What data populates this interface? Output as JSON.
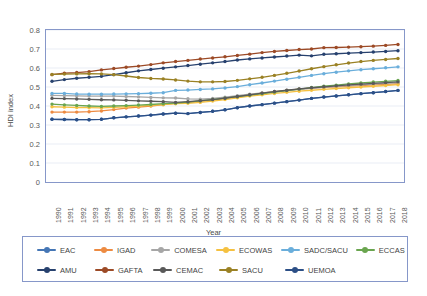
{
  "chart_data": {
    "type": "line",
    "title": "",
    "xlabel": "Year",
    "ylabel": "HDI index",
    "ylim": [
      0,
      0.8
    ],
    "ytick_step": 0.1,
    "yticks": [
      "0",
      "0.1",
      "0.2",
      "0.3",
      "0.4",
      "0.5",
      "0.6",
      "0.7",
      "0.8"
    ],
    "grid": true,
    "legend_position": "bottom",
    "markers": true,
    "x": [
      1990,
      1991,
      1992,
      1993,
      1994,
      1995,
      1996,
      1997,
      1998,
      1999,
      2000,
      2001,
      2002,
      2003,
      2004,
      2005,
      2006,
      2007,
      2008,
      2009,
      2010,
      2011,
      2012,
      2013,
      2014,
      2015,
      2016,
      2017,
      2018
    ],
    "categories": [
      "1990",
      "1991",
      "1992",
      "1993",
      "1994",
      "1995",
      "1996",
      "1997",
      "1998",
      "1999",
      "2000",
      "2001",
      "2002",
      "2003",
      "2004",
      "2005",
      "2006",
      "2007",
      "2008",
      "2009",
      "2010",
      "2011",
      "2012",
      "2013",
      "2014",
      "2015",
      "2016",
      "2017",
      "2018"
    ],
    "series": [
      {
        "name": "EAC",
        "color": "#4576b5",
        "values": [
          0.33,
          0.329,
          0.328,
          0.328,
          0.33,
          0.338,
          0.343,
          0.347,
          0.352,
          0.358,
          0.362,
          0.36,
          0.366,
          0.372,
          0.38,
          0.391,
          0.4,
          0.407,
          0.415,
          0.423,
          0.431,
          0.44,
          0.447,
          0.453,
          0.459,
          0.465,
          0.47,
          0.476,
          0.482
        ]
      },
      {
        "name": "IGAD",
        "color": "#ed8b42",
        "values": [
          0.368,
          0.368,
          0.368,
          0.37,
          0.374,
          0.381,
          0.389,
          0.394,
          0.4,
          0.407,
          0.414,
          0.418,
          0.424,
          0.431,
          0.439,
          0.449,
          0.459,
          0.467,
          0.475,
          0.482,
          0.489,
          0.494,
          0.498,
          0.501,
          0.505,
          0.508,
          0.511,
          0.514,
          0.517
        ]
      },
      {
        "name": "COMESA",
        "color": "#a6a6a6",
        "values": [
          0.456,
          0.455,
          0.453,
          0.452,
          0.452,
          0.452,
          0.45,
          0.448,
          0.445,
          0.443,
          0.442,
          0.438,
          0.436,
          0.44,
          0.446,
          0.454,
          0.462,
          0.469,
          0.476,
          0.482,
          0.488,
          0.493,
          0.498,
          0.503,
          0.507,
          0.511,
          0.515,
          0.519,
          0.523
        ]
      },
      {
        "name": "ECOWAS",
        "color": "#f5c141",
        "values": [
          0.396,
          0.394,
          0.392,
          0.391,
          0.39,
          0.393,
          0.396,
          0.399,
          0.403,
          0.407,
          0.412,
          0.414,
          0.419,
          0.426,
          0.434,
          0.443,
          0.452,
          0.459,
          0.466,
          0.472,
          0.478,
          0.483,
          0.488,
          0.492,
          0.496,
          0.5,
          0.504,
          0.508,
          0.512
        ]
      },
      {
        "name": "SADC/SACU",
        "color": "#6aaedb",
        "values": [
          0.466,
          0.466,
          0.463,
          0.462,
          0.462,
          0.463,
          0.464,
          0.465,
          0.467,
          0.47,
          0.482,
          0.484,
          0.487,
          0.49,
          0.495,
          0.502,
          0.512,
          0.521,
          0.531,
          0.541,
          0.551,
          0.561,
          0.57,
          0.578,
          0.585,
          0.591,
          0.596,
          0.601,
          0.606
        ]
      },
      {
        "name": "ECCAS",
        "color": "#6aa54f",
        "values": [
          0.41,
          0.406,
          0.403,
          0.4,
          0.398,
          0.4,
          0.402,
          0.405,
          0.408,
          0.412,
          0.415,
          0.42,
          0.427,
          0.434,
          0.441,
          0.449,
          0.457,
          0.465,
          0.473,
          0.481,
          0.489,
          0.497,
          0.504,
          0.51,
          0.516,
          0.521,
          0.526,
          0.53,
          0.534
        ]
      },
      {
        "name": "AMU",
        "color": "#27416e",
        "values": [
          0.53,
          0.539,
          0.546,
          0.551,
          0.556,
          0.565,
          0.575,
          0.585,
          0.592,
          0.599,
          0.606,
          0.613,
          0.62,
          0.627,
          0.634,
          0.642,
          0.648,
          0.653,
          0.658,
          0.663,
          0.668,
          0.664,
          0.672,
          0.675,
          0.678,
          0.681,
          0.684,
          0.687,
          0.691
        ]
      },
      {
        "name": "GAFTA",
        "color": "#9c4a26",
        "values": [
          0.565,
          0.573,
          0.576,
          0.581,
          0.59,
          0.597,
          0.604,
          0.61,
          0.618,
          0.627,
          0.634,
          0.64,
          0.647,
          0.653,
          0.659,
          0.666,
          0.673,
          0.681,
          0.687,
          0.692,
          0.697,
          0.7,
          0.707,
          0.708,
          0.71,
          0.712,
          0.715,
          0.719,
          0.724
        ]
      },
      {
        "name": "CEMAC",
        "color": "#595959",
        "values": [
          0.44,
          0.439,
          0.437,
          0.435,
          0.433,
          0.432,
          0.43,
          0.427,
          0.425,
          0.423,
          0.419,
          0.423,
          0.428,
          0.434,
          0.441,
          0.45,
          0.459,
          0.468,
          0.476,
          0.483,
          0.49,
          0.496,
          0.501,
          0.506,
          0.511,
          0.515,
          0.519,
          0.523,
          0.527
        ]
      },
      {
        "name": "SACU",
        "color": "#9a8124",
        "values": [
          0.566,
          0.568,
          0.569,
          0.57,
          0.569,
          0.565,
          0.558,
          0.55,
          0.545,
          0.542,
          0.537,
          0.531,
          0.527,
          0.527,
          0.529,
          0.535,
          0.543,
          0.551,
          0.561,
          0.572,
          0.584,
          0.596,
          0.607,
          0.617,
          0.626,
          0.634,
          0.64,
          0.645,
          0.65
        ]
      },
      {
        "name": "UEMOA",
        "color": "#2c4f86",
        "values": [
          0.33,
          0.329,
          0.328,
          0.328,
          0.33,
          0.338,
          0.343,
          0.347,
          0.352,
          0.358,
          0.362,
          0.36,
          0.366,
          0.372,
          0.38,
          0.391,
          0.4,
          0.407,
          0.415,
          0.423,
          0.431,
          0.44,
          0.447,
          0.453,
          0.459,
          0.465,
          0.47,
          0.476,
          0.482
        ]
      }
    ]
  },
  "legend": {
    "row1": [
      "EAC",
      "IGAD",
      "COMESA",
      "ECOWAS",
      "SADC/SACU",
      "ECCAS"
    ],
    "row2": [
      "AMU",
      "GAFTA",
      "CEMAC",
      "SACU",
      "UEMOA"
    ]
  },
  "axes": {
    "x_title": "Year",
    "y_title": "HDI index"
  }
}
